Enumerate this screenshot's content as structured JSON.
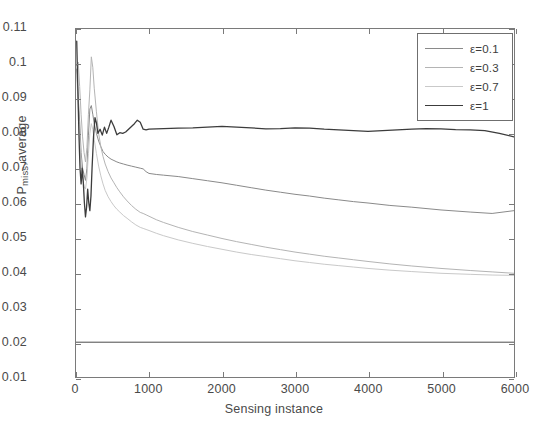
{
  "chart_data": {
    "type": "line",
    "title": "",
    "xlabel": "Sensing instance",
    "ylabel": "Pmiss,average",
    "ylabel_main": "P",
    "ylabel_sub": "miss",
    "ylabel_tail": ",average",
    "xlim": [
      0,
      6000
    ],
    "ylim": [
      0.01,
      0.11
    ],
    "grid": false,
    "legend_position": "top-right",
    "xticks": [
      0,
      1000,
      2000,
      3000,
      4000,
      5000,
      6000
    ],
    "xtick_labels": [
      "0",
      "1000",
      "2000",
      "3000",
      "4000",
      "5000",
      "6000"
    ],
    "yticks": [
      0.01,
      0.02,
      0.03,
      0.04,
      0.05,
      0.06,
      0.07,
      0.08,
      0.09,
      0.1,
      0.11
    ],
    "ytick_labels": [
      "0.01",
      "0.02",
      "0.03",
      "0.04",
      "0.05",
      "0.06",
      "0.07",
      "0.08",
      "0.09",
      "0.1",
      "0.11"
    ],
    "series": [
      {
        "name": "ε=0.1",
        "color": "#8a8a8a",
        "width": 1.0,
        "x": [
          10,
          30,
          50,
          70,
          90,
          110,
          130,
          150,
          170,
          190,
          210,
          230,
          250,
          280,
          310,
          340,
          370,
          400,
          440,
          480,
          520,
          560,
          600,
          650,
          700,
          760,
          820,
          880,
          920,
          960,
          1000,
          1100,
          1200,
          1400,
          1600,
          1800,
          2000,
          2200,
          2400,
          2600,
          2800,
          3000,
          3200,
          3400,
          3600,
          3800,
          4000,
          4300,
          4600,
          5000,
          5400,
          5700,
          6000
        ],
        "y": [
          0.0985,
          0.0905,
          0.0835,
          0.0745,
          0.07,
          0.0682,
          0.0665,
          0.07,
          0.0795,
          0.087,
          0.088,
          0.0855,
          0.0828,
          0.08,
          0.0778,
          0.0762,
          0.0748,
          0.074,
          0.0732,
          0.0726,
          0.0722,
          0.0718,
          0.0715,
          0.0712,
          0.0709,
          0.0706,
          0.0703,
          0.07,
          0.0698,
          0.069,
          0.0685,
          0.0682,
          0.068,
          0.0676,
          0.067,
          0.0664,
          0.0658,
          0.0651,
          0.0644,
          0.0637,
          0.0631,
          0.0625,
          0.062,
          0.0614,
          0.0609,
          0.0604,
          0.06,
          0.0593,
          0.0588,
          0.058,
          0.0574,
          0.057,
          0.0578
        ]
      },
      {
        "name": "ε=0.3",
        "color": "#b4b4b4",
        "width": 1.0,
        "x": [
          10,
          30,
          50,
          70,
          90,
          110,
          130,
          150,
          170,
          190,
          210,
          230,
          250,
          280,
          310,
          340,
          370,
          400,
          440,
          480,
          520,
          560,
          600,
          650,
          700,
          760,
          820,
          880,
          920,
          960,
          1000,
          1100,
          1200,
          1400,
          1600,
          1800,
          2000,
          2200,
          2400,
          2600,
          2800,
          3000,
          3200,
          3400,
          3600,
          3800,
          4000,
          4300,
          4600,
          5000,
          5400,
          5700,
          6000
        ],
        "y": [
          0.0995,
          0.1005,
          0.0935,
          0.0855,
          0.079,
          0.0745,
          0.0718,
          0.076,
          0.0855,
          0.0925,
          0.102,
          0.099,
          0.093,
          0.0862,
          0.08,
          0.0762,
          0.0734,
          0.0712,
          0.069,
          0.0672,
          0.0658,
          0.0644,
          0.0632,
          0.0618,
          0.0606,
          0.0593,
          0.0582,
          0.0573,
          0.057,
          0.0566,
          0.0562,
          0.0552,
          0.0544,
          0.053,
          0.0518,
          0.0508,
          0.0498,
          0.0489,
          0.0481,
          0.0473,
          0.0466,
          0.0459,
          0.0453,
          0.0447,
          0.0442,
          0.0437,
          0.0432,
          0.0425,
          0.0419,
          0.0412,
          0.0406,
          0.0402,
          0.0398
        ]
      },
      {
        "name": "ε=0.7",
        "color": "#c9c9c9",
        "width": 1.0,
        "x": [
          10,
          30,
          50,
          70,
          90,
          110,
          130,
          150,
          170,
          190,
          210,
          230,
          250,
          280,
          310,
          340,
          370,
          400,
          440,
          480,
          520,
          560,
          600,
          650,
          700,
          760,
          820,
          880,
          920,
          960,
          1000,
          1100,
          1200,
          1400,
          1600,
          1800,
          2000,
          2200,
          2400,
          2600,
          2800,
          3000,
          3200,
          3400,
          3600,
          3800,
          4000,
          4300,
          4600,
          5000,
          5400,
          5700,
          6000
        ],
        "y": [
          0.0965,
          0.088,
          0.08,
          0.0718,
          0.0672,
          0.0648,
          0.064,
          0.0672,
          0.0742,
          0.08,
          0.0828,
          0.0812,
          0.0782,
          0.0742,
          0.0706,
          0.0678,
          0.0655,
          0.0636,
          0.0618,
          0.0604,
          0.0592,
          0.0582,
          0.0574,
          0.0564,
          0.0556,
          0.0546,
          0.0537,
          0.053,
          0.0527,
          0.0524,
          0.0521,
          0.0513,
          0.0506,
          0.0494,
          0.0484,
          0.0475,
          0.0467,
          0.0459,
          0.0452,
          0.0446,
          0.044,
          0.0434,
          0.0429,
          0.0424,
          0.042,
          0.0416,
          0.0412,
          0.0407,
          0.0403,
          0.0398,
          0.0395,
          0.0393,
          0.0392
        ]
      },
      {
        "name": "ε=1",
        "color": "#3c3c3c",
        "width": 1.3,
        "x": [
          10,
          25,
          40,
          55,
          70,
          85,
          100,
          115,
          130,
          145,
          160,
          175,
          190,
          205,
          220,
          240,
          260,
          280,
          300,
          330,
          360,
          390,
          420,
          450,
          480,
          520,
          560,
          600,
          640,
          680,
          720,
          760,
          800,
          840,
          880,
          920,
          960,
          1000,
          1100,
          1200,
          1400,
          1600,
          1800,
          2000,
          2200,
          2400,
          2600,
          2800,
          3000,
          3200,
          3400,
          3600,
          3800,
          4000,
          4200,
          4400,
          4600,
          4800,
          5000,
          5200,
          5400,
          5600,
          5800,
          6000
        ],
        "y": [
          0.1065,
          0.093,
          0.08,
          0.07,
          0.0655,
          0.07,
          0.066,
          0.06,
          0.056,
          0.0588,
          0.064,
          0.06,
          0.0578,
          0.062,
          0.07,
          0.079,
          0.0845,
          0.083,
          0.08,
          0.0812,
          0.0795,
          0.0818,
          0.08,
          0.0818,
          0.0838,
          0.082,
          0.0796,
          0.0802,
          0.08,
          0.0804,
          0.0812,
          0.082,
          0.0828,
          0.0838,
          0.0832,
          0.0812,
          0.081,
          0.0812,
          0.0813,
          0.0814,
          0.0815,
          0.0816,
          0.0818,
          0.082,
          0.0818,
          0.0816,
          0.0813,
          0.0814,
          0.0816,
          0.0815,
          0.0812,
          0.081,
          0.0808,
          0.0806,
          0.0808,
          0.081,
          0.0812,
          0.0814,
          0.0813,
          0.0811,
          0.081,
          0.0808,
          0.08,
          0.079
        ]
      },
      {
        "name": "reference-line",
        "color": "#4a4a4a",
        "width": 1.0,
        "x": [
          0,
          6000
        ],
        "y": [
          0.02,
          0.02
        ]
      }
    ]
  },
  "legend": {
    "entries": [
      {
        "label": "ε=0.1",
        "color": "#8a8a8a"
      },
      {
        "label": "ε=0.3",
        "color": "#b4b4b4"
      },
      {
        "label": "ε=0.7",
        "color": "#c9c9c9"
      },
      {
        "label": "ε=1",
        "color": "#3c3c3c"
      }
    ]
  }
}
